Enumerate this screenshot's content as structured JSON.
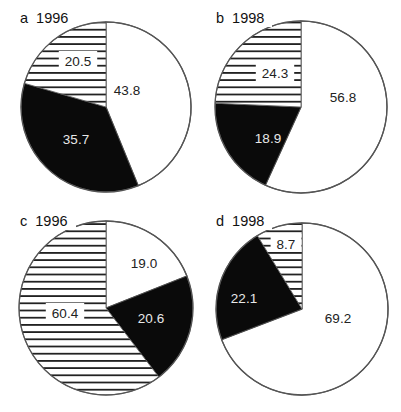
{
  "figure": {
    "panels_count": 4
  },
  "chart_data": [
    {
      "type": "pie",
      "panel_label": "a",
      "title": "1996",
      "start": "12 o'clock, clockwise",
      "slices": [
        {
          "value": 43.8,
          "label": "43.8",
          "fill": "white"
        },
        {
          "value": 35.7,
          "label": "35.7",
          "fill": "black"
        },
        {
          "value": 20.5,
          "label": "20.5",
          "fill": "hatched"
        }
      ],
      "geometry": {
        "cx": 106,
        "cy": 107,
        "r": 85
      },
      "label_positions": [
        [
          127,
          90
        ],
        [
          76,
          139
        ],
        [
          78,
          61
        ]
      ]
    },
    {
      "type": "pie",
      "panel_label": "b",
      "title": "1998",
      "start": "12 o'clock, clockwise",
      "slices": [
        {
          "value": 56.8,
          "label": "56.8",
          "fill": "white"
        },
        {
          "value": 18.9,
          "label": "18.9",
          "fill": "black"
        },
        {
          "value": 24.3,
          "label": "24.3",
          "fill": "hatched"
        }
      ],
      "geometry": {
        "cx": 301,
        "cy": 107,
        "r": 86
      },
      "label_positions": [
        [
          343,
          97
        ],
        [
          268,
          138
        ],
        [
          275,
          73
        ]
      ]
    },
    {
      "type": "pie",
      "panel_label": "c",
      "title": "1996",
      "start": "12 o'clock, clockwise",
      "slices": [
        {
          "value": 19.0,
          "label": "19.0",
          "fill": "white"
        },
        {
          "value": 20.6,
          "label": "20.6",
          "fill": "black"
        },
        {
          "value": 60.4,
          "label": "60.4",
          "fill": "hatched"
        }
      ],
      "geometry": {
        "cx": 106,
        "cy": 308,
        "r": 87
      },
      "label_positions": [
        [
          144,
          263
        ],
        [
          151,
          318
        ],
        [
          65,
          313
        ]
      ]
    },
    {
      "type": "pie",
      "panel_label": "d",
      "title": "1998",
      "start": "12 o'clock, clockwise",
      "slices": [
        {
          "value": 69.2,
          "label": "69.2",
          "fill": "white"
        },
        {
          "value": 22.1,
          "label": "22.1",
          "fill": "black"
        },
        {
          "value": 8.7,
          "label": "8.7",
          "fill": "hatched"
        }
      ],
      "geometry": {
        "cx": 302,
        "cy": 309,
        "r": 86
      },
      "label_positions": [
        [
          338,
          318
        ],
        [
          244,
          298
        ],
        [
          286,
          244
        ]
      ]
    }
  ],
  "panels": [
    {
      "label": "a",
      "year": "1996",
      "values": [
        "43.8",
        "35.7",
        "20.5"
      ]
    },
    {
      "label": "b",
      "year": "1998",
      "values": [
        "56.8",
        "18.9",
        "24.3"
      ]
    },
    {
      "label": "c",
      "year": "1996",
      "values": [
        "19.0",
        "20.6",
        "60.4"
      ]
    },
    {
      "label": "d",
      "year": "1998",
      "values": [
        "69.2",
        "22.1",
        "8.7"
      ]
    }
  ],
  "colors": {
    "outline": "#555555",
    "black_slice": "#0a0a0a",
    "hatch_line": "#222222",
    "background": "#ffffff",
    "label_on_white": "#222222",
    "label_on_black": "#e8e8e8"
  },
  "panel_title_positions": [
    [
      20,
      23
    ],
    [
      216,
      23
    ],
    [
      20,
      226
    ],
    [
      216,
      226
    ]
  ]
}
